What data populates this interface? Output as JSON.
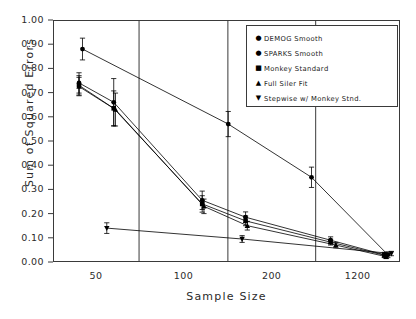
{
  "chart_data": {
    "type": "line",
    "title": "",
    "xlabel": "Sample Size",
    "ylabel": "Sum of Squared Errors",
    "ylim": [
      0.0,
      1.0
    ],
    "ytick_labels": [
      "1.00",
      "0.90",
      "0.80",
      "0.70",
      "0.60",
      "0.50",
      "0.40",
      "0.30",
      "0.20",
      "0.10",
      "0.00"
    ],
    "ytick_values": [
      1.0,
      0.9,
      0.8,
      0.7,
      0.6,
      0.5,
      0.4,
      0.3,
      0.2,
      0.1,
      0.0
    ],
    "xtick_labels": [
      "50",
      "100",
      "200",
      "1200"
    ],
    "grid": "vertical-only",
    "legend_position": "top-right",
    "error_bars": true,
    "series": [
      {
        "name": "DEMOG Smooth",
        "marker": "circle",
        "x": [
          0.085,
          0.505,
          0.745,
          0.965
        ],
        "values": [
          0.88,
          0.57,
          0.35,
          0.03
        ],
        "err": [
          0.045,
          0.052,
          0.042,
          0.012
        ]
      },
      {
        "name": "SPARKS Smooth",
        "marker": "circle",
        "x": [
          0.075,
          0.175,
          0.43,
          0.555,
          0.8,
          0.955
        ],
        "values": [
          0.74,
          0.66,
          0.255,
          0.185,
          0.09,
          0.03
        ],
        "err": [
          0.042,
          0.098,
          0.038,
          0.022,
          0.014,
          0.01
        ]
      },
      {
        "name": "Monkey Standard",
        "marker": "square",
        "x": [
          0.075,
          0.175,
          0.43,
          0.555,
          0.8,
          0.955
        ],
        "values": [
          0.73,
          0.635,
          0.24,
          0.17,
          0.082,
          0.028
        ],
        "err": [
          0.04,
          0.072,
          0.034,
          0.02,
          0.012,
          0.01
        ]
      },
      {
        "name": "Full Siler Fit",
        "marker": "triangle-up",
        "x": [
          0.075,
          0.18,
          0.435,
          0.56,
          0.815,
          0.96
        ],
        "values": [
          0.725,
          0.63,
          0.23,
          0.15,
          0.07,
          0.022
        ],
        "err": [
          0.038,
          0.068,
          0.03,
          0.018,
          0.011,
          0.008
        ]
      },
      {
        "name": "Stepwise w/ Monkey Stnd.",
        "marker": "triangle-down",
        "x": [
          0.155,
          0.545,
          0.975
        ],
        "values": [
          0.14,
          0.095,
          0.035
        ],
        "err": [
          0.022,
          0.014,
          0.009
        ]
      }
    ]
  },
  "legend": {
    "items": [
      {
        "label": "DEMOG Smooth",
        "glyph": "●"
      },
      {
        "label": "SPARKS Smooth",
        "glyph": "●"
      },
      {
        "label": "Monkey Standard",
        "glyph": "■"
      },
      {
        "label": "Full Siler Fit",
        "glyph": "▲"
      },
      {
        "label": "Stepwise w/ Monkey Stnd.",
        "glyph": "▼"
      }
    ]
  },
  "colors": {
    "axis": "#3a3a3a",
    "data": "#000000",
    "background": "#ffffff"
  }
}
